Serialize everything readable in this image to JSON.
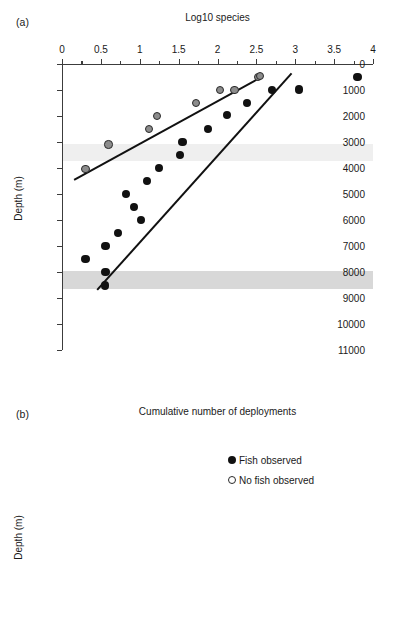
{
  "figure": {
    "panel_a_letter": "(a)",
    "panel_b_letter": "(b)"
  },
  "chart_data": [
    {
      "type": "scatter",
      "panel": "a",
      "title": "Log10 species",
      "xlabel": "Log10 species",
      "ylabel": "Depth (m)",
      "xlim": [
        0,
        4
      ],
      "ylim": [
        11000,
        0
      ],
      "y_inverted": true,
      "xticks": [
        0,
        0.5,
        1,
        1.5,
        2,
        2.5,
        3,
        3.5,
        4
      ],
      "xticklabels": [
        "0",
        "0.5",
        "1",
        "1.5",
        "2",
        "2.5",
        "3",
        "3.5",
        "4"
      ],
      "yticks": [
        0,
        1000,
        2000,
        3000,
        4000,
        5000,
        6000,
        7000,
        8000,
        9000,
        10000,
        11000
      ],
      "yticklabels": [
        "0",
        "1000",
        "2000",
        "3000",
        "4000",
        "5000",
        "6000",
        "7000",
        "8000",
        "9000",
        "10000",
        "11000"
      ],
      "grid": false,
      "xaxis_position": "top",
      "bands": [
        {
          "name": "upper-shaded-band",
          "y_from": 3080,
          "y_to": 3720,
          "color": "#efefef"
        },
        {
          "name": "lower-shaded-band",
          "y_from": 7980,
          "y_to": 8640,
          "color": "#d8d8d8"
        }
      ],
      "series": [
        {
          "name": "No fish observed",
          "marker": "gray-filled-circle",
          "color": "#8c8c8c",
          "points": [
            {
              "x": 0.3,
              "y": 4030
            },
            {
              "x": 0.6,
              "y": 3090
            },
            {
              "x": 1.12,
              "y": 2490
            },
            {
              "x": 1.22,
              "y": 2000
            },
            {
              "x": 1.72,
              "y": 1490
            },
            {
              "x": 2.03,
              "y": 1000
            },
            {
              "x": 2.22,
              "y": 1000
            },
            {
              "x": 2.52,
              "y": 500
            },
            {
              "x": 2.55,
              "y": 470
            }
          ],
          "fit_line": {
            "x1": 0.15,
            "y1": 4430,
            "x2": 2.56,
            "y2": 470
          }
        },
        {
          "name": "Fish observed",
          "marker": "black-filled-circle",
          "color": "#111111",
          "points": [
            {
              "x": 0.55,
              "y": 8520
            },
            {
              "x": 0.56,
              "y": 8010
            },
            {
              "x": 0.3,
              "y": 7490
            },
            {
              "x": 0.56,
              "y": 7000
            },
            {
              "x": 0.72,
              "y": 6490
            },
            {
              "x": 1.02,
              "y": 6010
            },
            {
              "x": 0.93,
              "y": 5490
            },
            {
              "x": 0.82,
              "y": 5010
            },
            {
              "x": 1.09,
              "y": 4490
            },
            {
              "x": 1.25,
              "y": 4000
            },
            {
              "x": 1.52,
              "y": 3490
            },
            {
              "x": 1.55,
              "y": 3000
            },
            {
              "x": 1.88,
              "y": 2490
            },
            {
              "x": 2.12,
              "y": 1970
            },
            {
              "x": 2.38,
              "y": 1490
            },
            {
              "x": 2.7,
              "y": 1000
            },
            {
              "x": 3.05,
              "y": 980
            },
            {
              "x": 3.8,
              "y": 500
            }
          ],
          "fit_line": {
            "x1": 0.45,
            "y1": 8660,
            "x2": 2.95,
            "y2": 330
          }
        }
      ]
    },
    {
      "type": "scatter",
      "panel": "b",
      "title": "Cumulative number of deployments",
      "xlabel": "Cumulative number of deployments",
      "ylabel": "Depth (m)",
      "xlim": [
        0,
        30
      ],
      "ylim": [
        10000,
        4000
      ],
      "y_inverted": true,
      "xticks": [
        0,
        5,
        10,
        15,
        20,
        25,
        30
      ],
      "xticklabels": [
        "0",
        "5",
        "10",
        "15",
        "20",
        "25",
        "30"
      ],
      "yticks": [
        4000,
        5000,
        6000,
        7000,
        8000,
        9000,
        10000
      ],
      "yticklabels": [
        "4000",
        "5000",
        "6000",
        "7000",
        "8000",
        "9000",
        "10000"
      ],
      "grid": false,
      "xaxis_position": "top",
      "legend_position": "upper-right",
      "series": [
        {
          "name": "Fish observed",
          "marker": "black-filled-circle",
          "color": "#111111",
          "points": [
            {
              "x": 1.0,
              "y": 4370
            },
            {
              "x": 2.0,
              "y": 4660
            },
            {
              "x": 3.2,
              "y": 5130
            },
            {
              "x": 4.3,
              "y": 5130
            },
            {
              "x": 5.3,
              "y": 5320
            },
            {
              "x": 6.2,
              "y": 5450
            },
            {
              "x": 7.1,
              "y": 5450
            },
            {
              "x": 8.3,
              "y": 6000
            },
            {
              "x": 9.2,
              "y": 6110
            },
            {
              "x": 10.1,
              "y": 6160
            },
            {
              "x": 11.1,
              "y": 6450
            },
            {
              "x": 12.3,
              "y": 6890
            },
            {
              "x": 13.3,
              "y": 6900
            },
            {
              "x": 14.2,
              "y": 6980
            },
            {
              "x": 15.1,
              "y": 6980
            },
            {
              "x": 16.0,
              "y": 7000
            },
            {
              "x": 16.9,
              "y": 7100
            },
            {
              "x": 17.9,
              "y": 7500
            },
            {
              "x": 18.8,
              "y": 7560
            },
            {
              "x": 19.7,
              "y": 7690
            }
          ]
        },
        {
          "name": "No fish observed",
          "marker": "open-circle",
          "color": "#ffffff",
          "points": [
            {
              "x": 20.7,
              "y": 7960
            },
            {
              "x": 21.6,
              "y": 8040
            },
            {
              "x": 22.4,
              "y": 8150
            },
            {
              "x": 23.3,
              "y": 8180
            },
            {
              "x": 24.3,
              "y": 8620
            },
            {
              "x": 25.1,
              "y": 8760
            },
            {
              "x": 26.1,
              "y": 9230
            },
            {
              "x": 26.9,
              "y": 9250
            },
            {
              "x": 27.9,
              "y": 9700
            }
          ]
        }
      ],
      "legend": [
        {
          "marker": "filled",
          "label": "Fish observed"
        },
        {
          "marker": "open",
          "label": "No fish observed"
        }
      ]
    }
  ]
}
